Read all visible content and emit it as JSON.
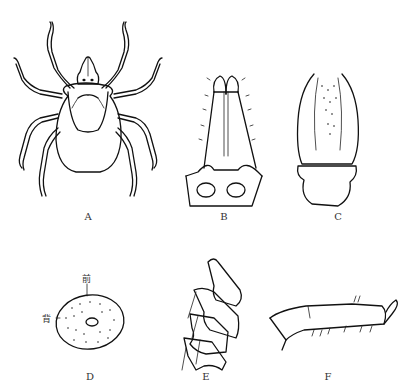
{
  "figure": {
    "panels": [
      {
        "id": "A",
        "label": "A",
        "description": "whole tick, dorsal view"
      },
      {
        "id": "B",
        "label": "B",
        "description": "capitulum, dorsal view"
      },
      {
        "id": "C",
        "label": "C",
        "description": "capitulum, ventral view"
      },
      {
        "id": "D",
        "label": "D",
        "description": "spiracular plate"
      },
      {
        "id": "E",
        "label": "E",
        "description": "coxae"
      },
      {
        "id": "F",
        "label": "F",
        "description": "tarsus"
      }
    ],
    "annotations": {
      "front": "前",
      "dorsal": "背"
    }
  }
}
